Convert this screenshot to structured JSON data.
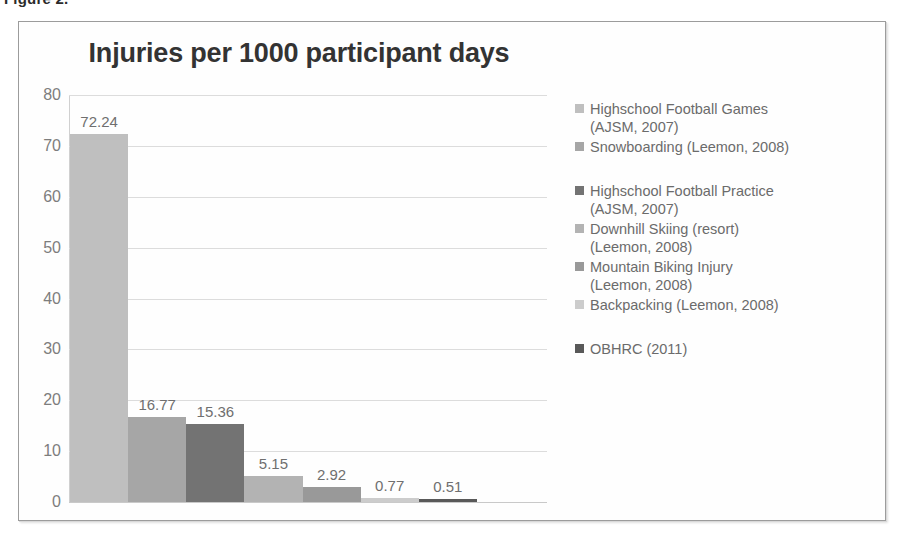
{
  "figure": {
    "caption": "Figure 2."
  },
  "chart_data": {
    "type": "bar",
    "title": "Injuries per 1000 participant days",
    "xlabel": "",
    "ylabel": "",
    "ylim": [
      0,
      80
    ],
    "ytick_labels": [
      "80",
      "70",
      "60",
      "50",
      "40",
      "30",
      "20",
      "10",
      "0"
    ],
    "ytick_values": [
      80,
      70,
      60,
      50,
      40,
      30,
      20,
      10,
      0
    ],
    "grid": true,
    "legend_position": "right",
    "categories": [
      "Highschool Football Games (AJSM, 2007)",
      "Snowboarding (Leemon, 2008)",
      "Highschool Football Practice (AJSM, 2007)",
      "Downhill Skiing (resort) (Leemon, 2008)",
      "Mountain Biking Injury (Leemon, 2008)",
      "Backpacking (Leemon, 2008)",
      "OBHRC (2011)"
    ],
    "values": [
      72.24,
      16.77,
      15.36,
      5.15,
      2.92,
      0.77,
      0.51
    ],
    "value_labels": [
      "72.24",
      "16.77",
      "15.36",
      "5.15",
      "2.92",
      "0.77",
      "0.51"
    ],
    "colors": [
      "#bfbfbf",
      "#a6a6a6",
      "#737373",
      "#b3b3b3",
      "#999999",
      "#cccccc",
      "#595959"
    ]
  },
  "legend": {
    "items": [
      {
        "line1": "Highschool Football Games",
        "line2": "(AJSM, 2007)",
        "color": "#bfbfbf",
        "spaced": false
      },
      {
        "line1": "Snowboarding (Leemon, 2008)",
        "line2": "",
        "color": "#a6a6a6",
        "spaced": false
      },
      {
        "line1": "Highschool Football Practice",
        "line2": "(AJSM, 2007)",
        "color": "#737373",
        "spaced": true
      },
      {
        "line1": "Downhill Skiing (resort)",
        "line2": "(Leemon, 2008)",
        "color": "#b3b3b3",
        "spaced": false
      },
      {
        "line1": "Mountain Biking Injury",
        "line2": "(Leemon, 2008)",
        "color": "#999999",
        "spaced": false
      },
      {
        "line1": "Backpacking (Leemon, 2008)",
        "line2": "",
        "color": "#cccccc",
        "spaced": false
      },
      {
        "line1": "OBHRC (2011)",
        "line2": "",
        "color": "#595959",
        "spaced": true
      }
    ]
  }
}
